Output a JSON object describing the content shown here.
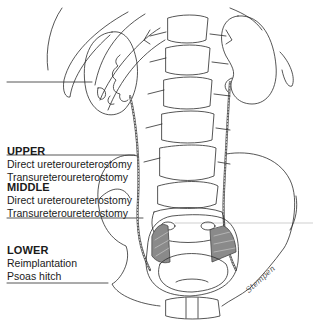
{
  "figure": {
    "line_color": "#2b2b2b",
    "shade_color": "#8a8a8a"
  },
  "levels": [
    {
      "title": "UPPER",
      "items": [
        "Direct ureteroureterostomy",
        "Transureteroureterostomy"
      ]
    },
    {
      "title": "MIDDLE",
      "items": [
        "Direct ureteroureterostomy",
        "Transureteroureterostomy"
      ]
    },
    {
      "title": "LOWER",
      "items": [
        "Reimplantation",
        "Psoas hitch"
      ]
    }
  ],
  "signature": "Stempen"
}
